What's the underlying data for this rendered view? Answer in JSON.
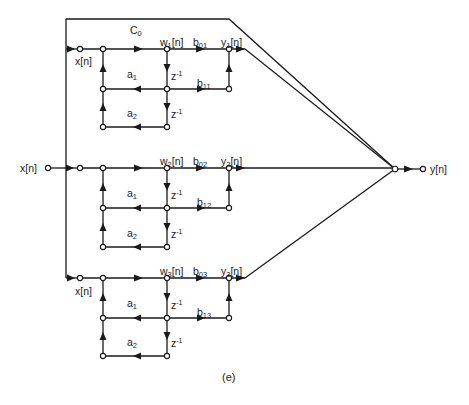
{
  "diagram": {
    "caption": "(e)",
    "type": "parallel-form IIR filter signal flow graph",
    "input_label": "x[n]",
    "output_label": "y[n]",
    "feedthrough_gain": {
      "base": "C",
      "sub": "0"
    },
    "sections": [
      {
        "input": "x[n]",
        "state": {
          "base": "w",
          "sub": "1",
          "suffix": "[n]"
        },
        "output": {
          "base": "y",
          "sub": "1",
          "suffix": "[n]"
        },
        "b0": {
          "base": "b",
          "sub": "01"
        },
        "b1": {
          "base": "b",
          "sub": "11"
        },
        "a1": {
          "base": "a",
          "sub": "1"
        },
        "a2": {
          "base": "a",
          "sub": "2"
        },
        "delay": {
          "base": "z",
          "sup": "-1"
        }
      },
      {
        "input": "",
        "state": {
          "base": "w",
          "sub": "2",
          "suffix": "[n]"
        },
        "output": {
          "base": "y",
          "sub": "2",
          "suffix": "[n]"
        },
        "b0": {
          "base": "b",
          "sub": "02"
        },
        "b1": {
          "base": "b",
          "sub": "12"
        },
        "a1": {
          "base": "a",
          "sub": "1"
        },
        "a2": {
          "base": "a",
          "sub": "2"
        },
        "delay": {
          "base": "z",
          "sup": "-1"
        }
      },
      {
        "input": "x[n]",
        "state": {
          "base": "w",
          "sub": "3",
          "suffix": "[n]"
        },
        "output": {
          "base": "y",
          "sub": "3",
          "suffix": "[n]"
        },
        "b0": {
          "base": "b",
          "sub": "03"
        },
        "b1": {
          "base": "b",
          "sub": "13"
        },
        "a1": {
          "base": "a",
          "sub": "1"
        },
        "a2": {
          "base": "a",
          "sub": "2"
        },
        "delay": {
          "base": "z",
          "sup": "-1"
        }
      }
    ],
    "colors": {
      "line": "#1a1a1a",
      "background": "#ffffff"
    }
  }
}
